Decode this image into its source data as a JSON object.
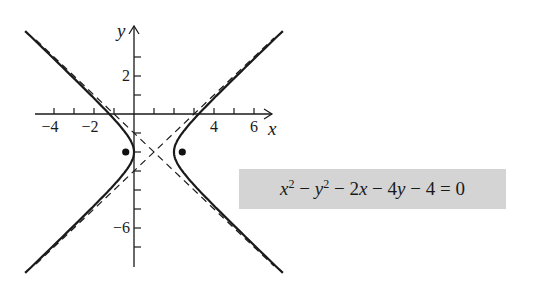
{
  "chart_data": {
    "type": "line",
    "title": "",
    "xlabel": "x",
    "ylabel": "y",
    "xlim": [
      -4.5,
      7
    ],
    "ylim": [
      -8,
      4.5
    ],
    "grid": false,
    "x_ticks": [
      -4,
      -3,
      -2,
      -1,
      1,
      2,
      3,
      4,
      5,
      6
    ],
    "x_tick_labels": [
      {
        "value": -4,
        "label": "−4"
      },
      {
        "value": -2,
        "label": "−2"
      },
      {
        "value": 4,
        "label": "4"
      },
      {
        "value": 6,
        "label": "6"
      }
    ],
    "y_ticks": [
      3,
      2,
      1,
      -1,
      -2,
      -3,
      -4,
      -5,
      -6,
      -7
    ],
    "y_tick_labels": [
      {
        "value": 2,
        "label": "2"
      },
      {
        "value": -6,
        "label": "−6"
      }
    ],
    "equation": "x^2 - y^2 - 2x - 4y - 4 = 0",
    "hyperbola": {
      "center": [
        1,
        -2
      ],
      "a": 1,
      "b": 1,
      "orientation": "horizontal",
      "x_range": [
        -4.9,
        7.0
      ]
    },
    "asymptotes": [
      {
        "equation": "y = x - 3",
        "style": "dashed"
      },
      {
        "equation": "y = -x - 1",
        "style": "dashed"
      }
    ],
    "foci": [
      [
        -0.414,
        -2
      ],
      [
        2.414,
        -2
      ]
    ],
    "series": [
      {
        "name": "hyperbola",
        "style": "solid"
      },
      {
        "name": "asymptotes",
        "style": "dashed"
      },
      {
        "name": "foci",
        "style": "points"
      }
    ]
  },
  "equation_box": {
    "x_sq": "x",
    "exp1": "2",
    "minus1": " − ",
    "y_sq": "y",
    "exp2": "2",
    "rest1": " − 2",
    "x": "x",
    "rest2": " − 4",
    "y": "y",
    "rest3": " − 4 = 0"
  },
  "axes": {
    "x_label": "x",
    "y_label": "y"
  }
}
